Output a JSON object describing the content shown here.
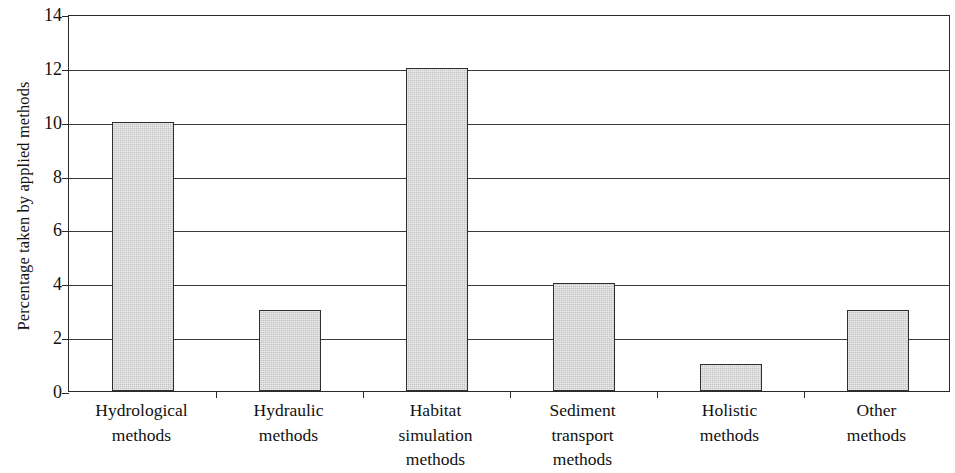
{
  "chart_data": {
    "type": "bar",
    "title": "",
    "xlabel": "",
    "ylabel": "Percentage taken by applied methods",
    "ylim": [
      0,
      14
    ],
    "yticks": [
      0,
      2,
      4,
      6,
      8,
      10,
      12,
      14
    ],
    "grid": true,
    "legend": null,
    "categories": [
      "Hydrological methods",
      "Hydraulic methods",
      "Habitat simulation methods",
      "Sediment transport methods",
      "Holistic methods",
      "Other methods"
    ],
    "category_lines": [
      [
        "Hydrological",
        "methods"
      ],
      [
        "Hydraulic",
        "methods"
      ],
      [
        "Habitat",
        "simulation",
        "methods"
      ],
      [
        "Sediment",
        "transport",
        "methods"
      ],
      [
        "Holistic",
        "methods"
      ],
      [
        "Other",
        "methods"
      ]
    ],
    "values": [
      10,
      3,
      12,
      4,
      1,
      3
    ],
    "bar_color": "#d2d2d2",
    "bar_edge_color": "#2e2e2e",
    "axis_color": "#2a2a2a"
  },
  "axis": {
    "y_tick_labels": [
      "0",
      "2",
      "4",
      "6",
      "8",
      "10",
      "12",
      "14"
    ],
    "y_title": "Percentage taken by applied methods"
  }
}
